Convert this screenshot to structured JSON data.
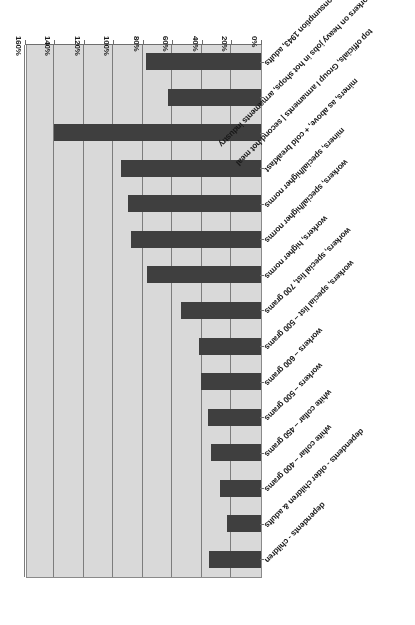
{
  "chart_data": {
    "type": "bar",
    "orientation": "horizontal",
    "title": "",
    "subtitle": "",
    "xlabel": "",
    "ylabel": "",
    "xlim": [
      0,
      160
    ],
    "grid": true,
    "legend": "none",
    "tick_suffix": "%",
    "tick_labels": [
      "0%",
      "20%",
      "40%",
      "60%",
      "80%",
      "100%",
      "120%",
      "140%",
      "160%"
    ],
    "tick_values": [
      0,
      20,
      40,
      60,
      80,
      100,
      120,
      140,
      160
    ],
    "categories": [
      "dependents - children",
      "dependents - older children & adults",
      "white collar – 400 grams",
      "white collar – 450 grams",
      "workers – 500 grams",
      "workers – 600 grams",
      "workers, special list – 500 grams",
      "workers, special list, 700 grams",
      "workers, higher norms",
      "workers, special/higher norms",
      "miners, special/higher norms",
      "miners, as above, + cold breakfast",
      "top officials, Group I armaments | second hot meal",
      "workers on heavy jobs in hot shops, armaments industry",
      "Actual consumption 1943, adults"
    ],
    "values": [
      35,
      23,
      28,
      34,
      36,
      41,
      42,
      54,
      77,
      88,
      90,
      95,
      140,
      63,
      78
    ],
    "bar_color": "#3f3f3f",
    "plot_background": "#d9d9d9",
    "gridline_color": "#7d7d7d",
    "axis_color": "#6e6e6e"
  }
}
